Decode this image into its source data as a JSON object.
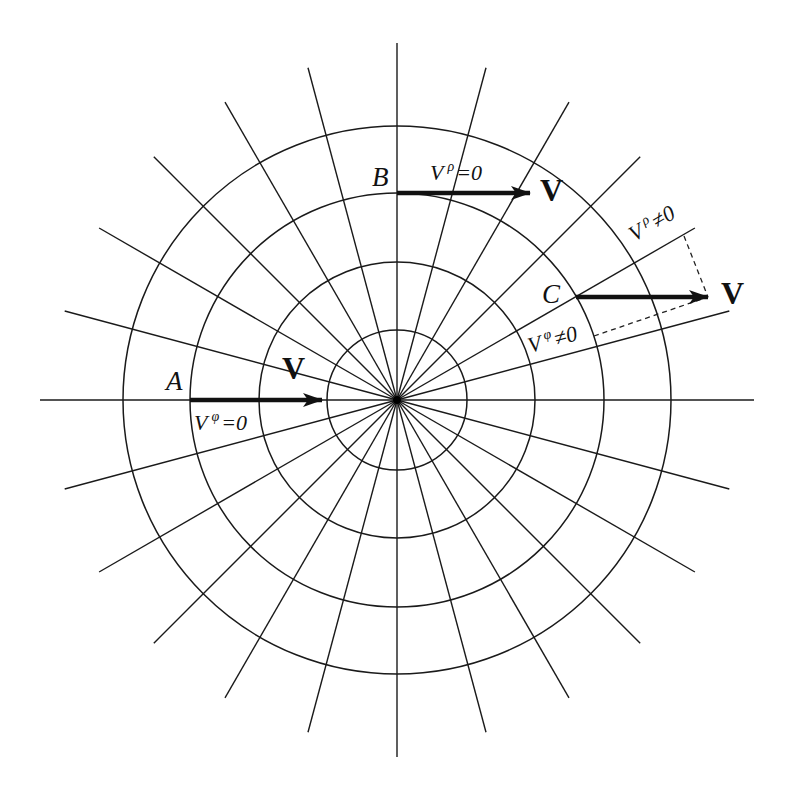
{
  "diagram": {
    "center": {
      "x": 397,
      "y": 400
    },
    "circle_radii": [
      70,
      138,
      207,
      274
    ],
    "radial_spacing_deg": 15,
    "radial_length": 344,
    "axis_length": 357,
    "stroke_color": "#1a1a1a",
    "points": {
      "A": {
        "label": "A",
        "x": 190,
        "y": 400
      },
      "B": {
        "label": "B",
        "x": 397,
        "y": 193
      },
      "C": {
        "label": "C",
        "x": 576,
        "y": 297
      }
    },
    "vectors": {
      "A": {
        "label": "V",
        "x1": 190,
        "y1": 400,
        "x2": 322,
        "y2": 400
      },
      "B": {
        "label": "V",
        "x1": 397,
        "y1": 193,
        "x2": 530,
        "y2": 193
      },
      "C": {
        "label": "V",
        "x1": 576,
        "y1": 297,
        "x2": 708,
        "y2": 297
      }
    },
    "annotations": {
      "A_component": {
        "base": "V",
        "sup": "φ",
        "rest": "=0"
      },
      "B_component": {
        "base": "V",
        "sup": "ρ",
        "rest": "=0"
      },
      "C_rho_component": {
        "base": "V",
        "sup": "ρ",
        "rest": "≠0"
      },
      "C_phi_component": {
        "base": "V",
        "sup": "φ",
        "rest": "≠0"
      }
    }
  }
}
